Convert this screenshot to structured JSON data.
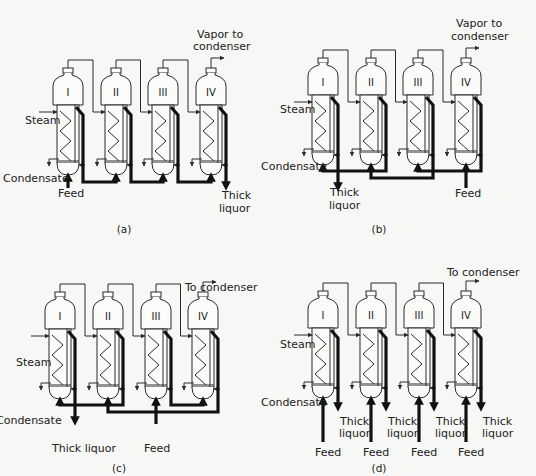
{
  "figure": {
    "panels": [
      {
        "id": "a",
        "caption": "(a)",
        "arrangement": "forward-feed",
        "effects": [
          "I",
          "II",
          "III",
          "IV"
        ],
        "labels": {
          "vapor_out": [
            "Vapor to",
            "condenser"
          ],
          "steam": "Steam",
          "condensate": "Condensate",
          "feed": "Feed",
          "thick_liquor": [
            "Thick",
            "liquor"
          ]
        }
      },
      {
        "id": "b",
        "caption": "(b)",
        "arrangement": "backward-feed",
        "effects": [
          "I",
          "II",
          "III",
          "IV"
        ],
        "labels": {
          "vapor_out": [
            "Vapor to",
            "condenser"
          ],
          "steam": "Steam",
          "condensate": "Condensate",
          "feed": "Feed",
          "thick_liquor": [
            "Thick",
            "liquor"
          ]
        }
      },
      {
        "id": "c",
        "caption": "(c)",
        "arrangement": "mixed-feed",
        "effects": [
          "I",
          "II",
          "III",
          "IV"
        ],
        "labels": {
          "vapor_out": [
            "To condenser"
          ],
          "steam": "Steam",
          "condensate": "Condensate",
          "feed": "Feed",
          "thick_liquor": [
            "Thick liquor"
          ]
        }
      },
      {
        "id": "d",
        "caption": "(d)",
        "arrangement": "parallel-feed",
        "effects": [
          "I",
          "II",
          "III",
          "IV"
        ],
        "labels": {
          "vapor_out": [
            "To condenser"
          ],
          "steam": "Steam",
          "condensate": "Condensate",
          "feed": "Feed",
          "thick_liquor": [
            "Thick",
            "liquor"
          ]
        }
      }
    ]
  },
  "colors": {
    "line": "#2a2a2a",
    "liquor": "#111111",
    "background": "#f7f7f5"
  }
}
